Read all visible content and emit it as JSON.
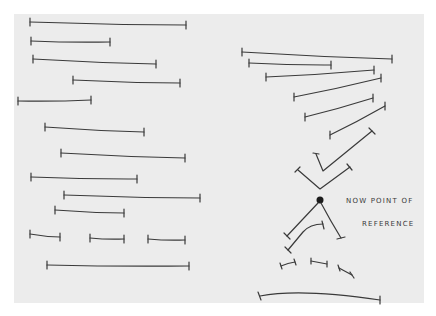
{
  "image": {
    "description": "Hand-drawn sketch on paper: rows of horizontal timeline segments with end ticks on the left; on the right, segments converge into V shapes toward a dot annotated as a point of reference, then diverge below",
    "annotation": {
      "line1": "NOW POINT OF",
      "line2": "REFERENCE"
    },
    "colors": {
      "background": "#ffffff",
      "paper": "#ececec",
      "ink": "#3a3a3a"
    },
    "left_segments": [
      {
        "x1": 30,
        "y1": 22,
        "x2": 186,
        "y2": 25
      },
      {
        "x1": 31,
        "y1": 41,
        "x2": 110,
        "y2": 42
      },
      {
        "x1": 33,
        "y1": 59,
        "x2": 156,
        "y2": 64
      },
      {
        "x1": 73,
        "y1": 80,
        "x2": 180,
        "y2": 83
      },
      {
        "x1": 18,
        "y1": 101,
        "x2": 91,
        "y2": 100
      },
      {
        "x1": 45,
        "y1": 127,
        "x2": 144,
        "y2": 132
      },
      {
        "x1": 61,
        "y1": 153,
        "x2": 185,
        "y2": 158
      },
      {
        "x1": 31,
        "y1": 177,
        "x2": 137,
        "y2": 179
      },
      {
        "x1": 64,
        "y1": 195,
        "x2": 200,
        "y2": 198
      },
      {
        "x1": 55,
        "y1": 210,
        "x2": 124,
        "y2": 213
      },
      {
        "x1": 30,
        "y1": 234,
        "x2": 60,
        "y2": 237
      },
      {
        "x1": 90,
        "y1": 238,
        "x2": 124,
        "y2": 239
      },
      {
        "x1": 148,
        "y1": 239,
        "x2": 185,
        "y2": 240
      },
      {
        "x1": 47,
        "y1": 265,
        "x2": 189,
        "y2": 266
      }
    ],
    "right_segments": [
      {
        "x1": 242,
        "y1": 52,
        "x2": 392,
        "y2": 59
      },
      {
        "x1": 249,
        "y1": 63,
        "x2": 331,
        "y2": 65
      },
      {
        "x1": 266,
        "y1": 77,
        "x2": 374,
        "y2": 70
      },
      {
        "x1": 294,
        "y1": 97,
        "x2": 381,
        "y2": 78
      },
      {
        "x1": 305,
        "y1": 117,
        "x2": 373,
        "y2": 98
      },
      {
        "x1": 330,
        "y1": 135,
        "x2": 385,
        "y2": 106
      }
    ],
    "reference_dot": {
      "cx": 320,
      "cy": 200,
      "r": 3.5
    }
  }
}
